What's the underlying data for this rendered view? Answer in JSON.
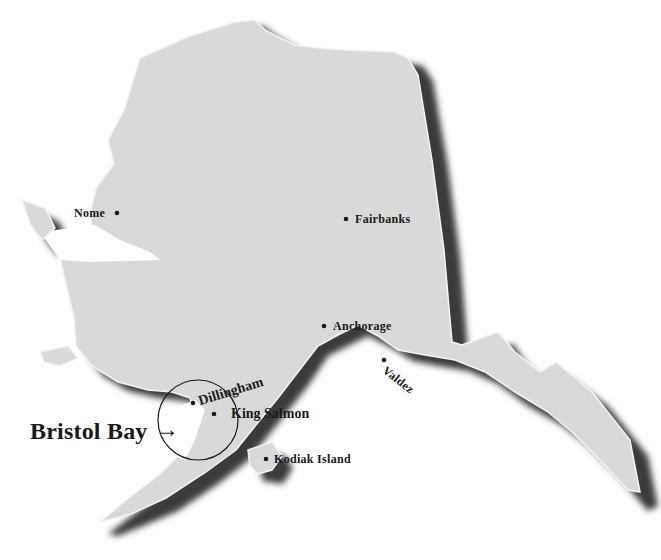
{
  "map": {
    "region": "Alaska",
    "colors": {
      "land": "#d9d9d9",
      "land_edge": "#f4f4f4",
      "shadow": "#3a3a3a",
      "background": "#ffffff",
      "text": "#1a1a1a"
    }
  },
  "cities": [
    {
      "name": "Nome"
    },
    {
      "name": "Fairbanks"
    },
    {
      "name": "Anchorage"
    },
    {
      "name": "Valdez"
    },
    {
      "name": "Dillingham"
    },
    {
      "name": "King Salmon"
    },
    {
      "name": "Kodiak Island"
    }
  ],
  "callout": {
    "label": "Bristol Bay",
    "arrow": "→"
  }
}
